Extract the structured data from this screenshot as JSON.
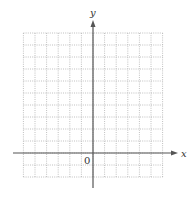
{
  "diagram": {
    "type": "coordinate-plane",
    "x_axis_label": "x",
    "y_axis_label": "y",
    "origin_label": "0",
    "grid": {
      "columns": 12,
      "rows": 12,
      "columns_left_of_origin": 6,
      "columns_right_of_origin": 6,
      "rows_above_origin": 10,
      "rows_below_origin": 2,
      "line_style": "dotted",
      "line_color": "#b0b0b0"
    },
    "axis_color": "#555555"
  }
}
